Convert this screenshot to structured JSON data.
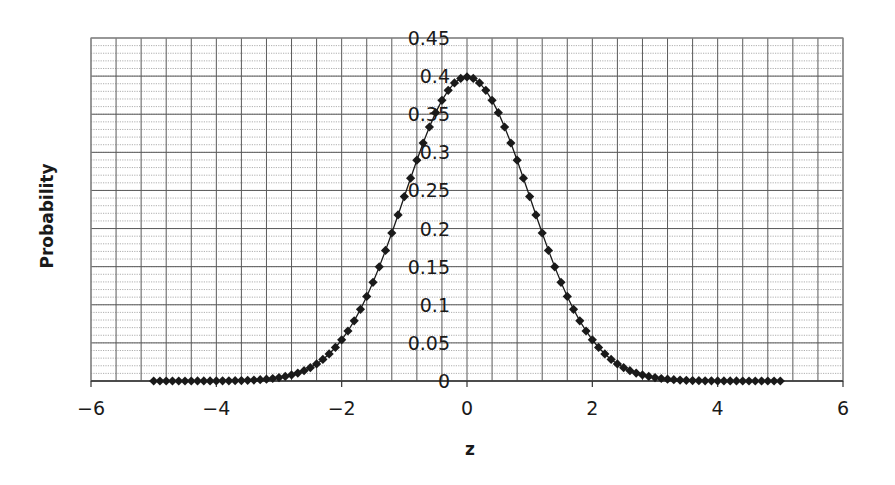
{
  "chart_data": {
    "type": "scatter",
    "title": "",
    "xlabel": "z",
    "ylabel": "Probability",
    "xlim": [
      -6,
      6
    ],
    "ylim": [
      0,
      0.45
    ],
    "x_ticks": [
      -6,
      -4,
      -2,
      0,
      2,
      4,
      6
    ],
    "x_tick_labels": [
      "-6",
      "-4",
      "-2",
      "0",
      "2",
      "4",
      "6"
    ],
    "y_ticks": [
      0,
      0.05,
      0.1,
      0.15,
      0.2,
      0.25,
      0.3,
      0.35,
      0.4,
      0.45
    ],
    "y_tick_labels": [
      "0",
      "0.05",
      "0.1",
      "0.15",
      "0.2",
      "0.25",
      "0.3",
      "0.35",
      "0.4",
      "0.45"
    ],
    "grid": {
      "major_x_step": 0.4,
      "major_y_step": 0.05,
      "minor_y_step": 0.01
    },
    "legend": "none",
    "y_axis_position": "x=0",
    "marker": "diamond",
    "line": "smooth",
    "color": "#1a1a1a",
    "series": [
      {
        "name": "Standard normal PDF",
        "x": [
          -5.0,
          -4.9,
          -4.8,
          -4.7,
          -4.6,
          -4.5,
          -4.4,
          -4.3,
          -4.2,
          -4.1,
          -4.0,
          -3.9,
          -3.8,
          -3.7,
          -3.6,
          -3.5,
          -3.4,
          -3.3,
          -3.2,
          -3.1,
          -3.0,
          -2.9,
          -2.8,
          -2.7,
          -2.6,
          -2.5,
          -2.4,
          -2.3,
          -2.2,
          -2.1,
          -2.0,
          -1.9,
          -1.8,
          -1.7,
          -1.6,
          -1.5,
          -1.4,
          -1.3,
          -1.2,
          -1.1,
          -1.0,
          -0.9,
          -0.8,
          -0.7,
          -0.6,
          -0.5,
          -0.4,
          -0.3,
          -0.2,
          -0.1,
          0.0,
          0.1,
          0.2,
          0.3,
          0.4,
          0.5,
          0.6,
          0.7,
          0.8,
          0.9,
          1.0,
          1.1,
          1.2,
          1.3,
          1.4,
          1.5,
          1.6,
          1.7,
          1.8,
          1.9,
          2.0,
          2.1,
          2.2,
          2.3,
          2.4,
          2.5,
          2.6,
          2.7,
          2.8,
          2.9,
          3.0,
          3.1,
          3.2,
          3.3,
          3.4,
          3.5,
          3.6,
          3.7,
          3.8,
          3.9,
          4.0,
          4.1,
          4.2,
          4.3,
          4.4,
          4.5,
          4.6,
          4.7,
          4.8,
          4.9,
          5.0
        ],
        "y": [
          1.5e-06,
          2.4e-06,
          4e-06,
          6.3e-06,
          1e-05,
          1.6e-05,
          2.46e-05,
          3.79e-05,
          5.89e-05,
          8.93e-05,
          0.0001338,
          0.0001987,
          0.0002919,
          0.0004248,
          0.0006119,
          0.0008727,
          0.0012322,
          0.0017226,
          0.0023841,
          0.0032668,
          0.0044318,
          0.0059525,
          0.0079155,
          0.0104209,
          0.013583,
          0.0175283,
          0.0223945,
          0.028327,
          0.0354746,
          0.0439836,
          0.053991,
          0.0656158,
          0.0789502,
          0.0940491,
          0.1109208,
          0.1295176,
          0.1497275,
          0.1713686,
          0.1941861,
          0.2178522,
          0.2419707,
          0.2660852,
          0.2896916,
          0.3122539,
          0.3332246,
          0.3520653,
          0.3682701,
          0.3813878,
          0.3910427,
          0.3969525,
          0.3989423,
          0.3969525,
          0.3910427,
          0.3813878,
          0.3682701,
          0.3520653,
          0.3332246,
          0.3122539,
          0.2896916,
          0.2660852,
          0.2419707,
          0.2178522,
          0.1941861,
          0.1713686,
          0.1497275,
          0.1295176,
          0.1109208,
          0.0940491,
          0.0789502,
          0.0656158,
          0.053991,
          0.0439836,
          0.0354746,
          0.028327,
          0.0223945,
          0.0175283,
          0.013583,
          0.0104209,
          0.0079155,
          0.0059525,
          0.0044318,
          0.0032668,
          0.0023841,
          0.0017226,
          0.0012322,
          0.0008727,
          0.0006119,
          0.0004248,
          0.0002919,
          0.0001987,
          0.0001338,
          8.93e-05,
          5.89e-05,
          3.79e-05,
          2.46e-05,
          1.6e-05,
          1e-05,
          6.3e-06,
          4e-06,
          2.4e-06,
          1.5e-06
        ]
      }
    ]
  },
  "layout": {
    "plot_left": 91,
    "plot_right": 843,
    "plot_top": 38,
    "plot_bottom": 381
  }
}
